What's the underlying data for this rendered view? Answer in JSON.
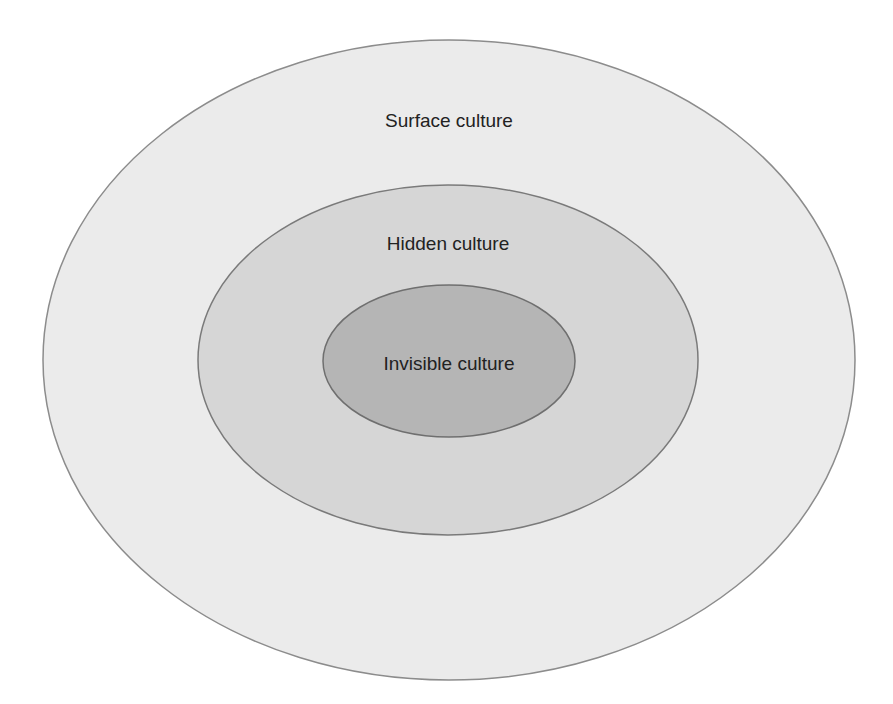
{
  "diagram": {
    "type": "nested-ellipses",
    "layers": [
      {
        "label": "Surface culture",
        "fill": "#ebebeb",
        "stroke": "#8c8c8c",
        "cx": 449,
        "cy": 360,
        "rx": 406,
        "ry": 320,
        "label_x": 449,
        "label_y": 127
      },
      {
        "label": "Hidden culture",
        "fill": "#d6d6d6",
        "stroke": "#7a7a7a",
        "cx": 448,
        "cy": 360,
        "rx": 250,
        "ry": 175,
        "label_x": 448,
        "label_y": 250
      },
      {
        "label": "Invisible culture",
        "fill": "#b5b5b5",
        "stroke": "#6f6f6f",
        "cx": 449,
        "cy": 361,
        "rx": 126,
        "ry": 76,
        "label_x": 449,
        "label_y": 370
      }
    ]
  }
}
